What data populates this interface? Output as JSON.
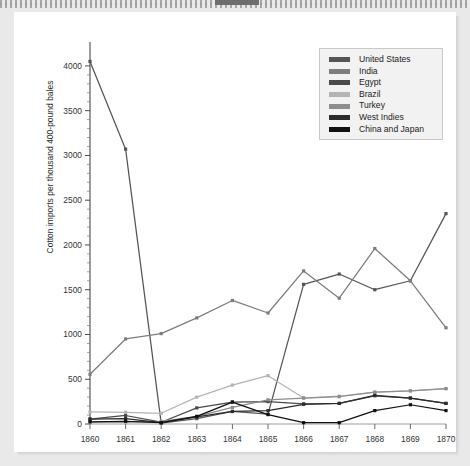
{
  "page": {
    "background_color": "#e9e9e9",
    "card_color": "#ffffff"
  },
  "chart_data": {
    "type": "line",
    "title": "",
    "subtitle": "",
    "xlabel": "",
    "ylabel": "Cotton imports per thousand 400-pound bales",
    "x": [
      1860,
      1861,
      1862,
      1863,
      1864,
      1865,
      1866,
      1867,
      1868,
      1869,
      1870
    ],
    "xticklabels": [
      "1860",
      "1861",
      "1862",
      "1863",
      "1864",
      "1865",
      "1866",
      "1867",
      "1868",
      "1869",
      "1870"
    ],
    "yticklabels": [
      "0",
      "500",
      "1000",
      "1500",
      "2000",
      "2500",
      "3000",
      "3500",
      "4000"
    ],
    "yticks": [
      0,
      500,
      1000,
      1500,
      2000,
      2500,
      3000,
      3500,
      4000
    ],
    "xlim": [
      1860,
      1870
    ],
    "ylim": [
      0,
      4200
    ],
    "grid": false,
    "legend_position": "top-right",
    "marker": "square",
    "series": [
      {
        "name": "United States",
        "color": "#555555",
        "values": [
          4050,
          3070,
          10,
          60,
          140,
          110,
          1560,
          1675,
          1500,
          1600,
          2350
        ]
      },
      {
        "name": "India",
        "color": "#7d7d7d",
        "values": [
          555,
          950,
          1010,
          1185,
          1380,
          1240,
          1710,
          1405,
          1960,
          1600,
          1075
        ]
      },
      {
        "name": "Egypt",
        "color": "#4a4a4a",
        "values": [
          55,
          95,
          20,
          180,
          245,
          250,
          225,
          230,
          315,
          290,
          230
        ]
      },
      {
        "name": "Brazil",
        "color": "#b4b4b4",
        "values": [
          135,
          130,
          120,
          300,
          435,
          540,
          290,
          310,
          355,
          370,
          395
        ]
      },
      {
        "name": "Turkey",
        "color": "#8d8d8d",
        "values": [
          20,
          25,
          30,
          85,
          185,
          270,
          290,
          305,
          355,
          370,
          395
        ]
      },
      {
        "name": "West Indies",
        "color": "#2b2b2b",
        "values": [
          55,
          60,
          15,
          80,
          140,
          150,
          220,
          230,
          320,
          290,
          230
        ]
      },
      {
        "name": "China and Japan",
        "color": "#111111",
        "values": [
          25,
          30,
          15,
          85,
          245,
          105,
          15,
          15,
          150,
          215,
          150
        ]
      }
    ]
  },
  "legend": {
    "items": [
      {
        "label": "United States",
        "color": "#555555"
      },
      {
        "label": "India",
        "color": "#7d7d7d"
      },
      {
        "label": "Egypt",
        "color": "#4a4a4a"
      },
      {
        "label": "Brazil",
        "color": "#b4b4b4"
      },
      {
        "label": "Turkey",
        "color": "#8d8d8d"
      },
      {
        "label": "West Indies",
        "color": "#2b2b2b"
      },
      {
        "label": "China and Japan",
        "color": "#111111"
      }
    ]
  }
}
